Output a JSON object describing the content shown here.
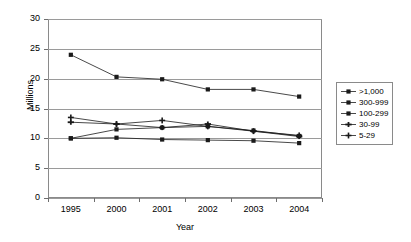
{
  "chart_data": {
    "type": "line",
    "title": "",
    "xlabel": "Year",
    "ylabel": "Millions",
    "categories": [
      "1995",
      "2000",
      "2001",
      "2002",
      "2003",
      "2004"
    ],
    "ylim": [
      0,
      30
    ],
    "yticks": [
      0,
      5,
      10,
      15,
      20,
      25,
      30
    ],
    "grid": true,
    "legend_position": "right",
    "series": [
      {
        "name": ">1,000",
        "marker": "diamond",
        "values": [
          24.0,
          20.3,
          19.9,
          18.2,
          18.2,
          17.0
        ]
      },
      {
        "name": "300-999",
        "marker": "square",
        "values": [
          10.0,
          10.1,
          9.8,
          9.7,
          9.6,
          9.2
        ]
      },
      {
        "name": "100-299",
        "marker": "triangle",
        "values": [
          10.0,
          11.5,
          11.8,
          12.0,
          11.3,
          10.4
        ]
      },
      {
        "name": "30-99",
        "marker": "cross",
        "values": [
          12.7,
          12.4,
          11.8,
          12.4,
          11.2,
          10.3
        ]
      },
      {
        "name": "5-29",
        "marker": "star",
        "values": [
          13.5,
          12.4,
          13.0,
          12.0,
          11.2,
          10.5
        ]
      }
    ]
  },
  "axes": {
    "y_title": "Millions",
    "x_title": "Year",
    "y_labels": [
      "30",
      "25",
      "20",
      "15",
      "10",
      "5",
      "0"
    ],
    "x_labels": [
      "1995",
      "2000",
      "2001",
      "2002",
      "2003",
      "2004"
    ]
  },
  "legend": {
    "items": [
      {
        "label": ">1,000"
      },
      {
        "label": "300-999"
      },
      {
        "label": "100-299"
      },
      {
        "label": "30-99"
      },
      {
        "label": "5-29"
      }
    ]
  },
  "colors": {
    "series_line": "#1a1a1a",
    "grid": "#9a9a9a",
    "frame": "#8a8a8a",
    "text": "#000000"
  }
}
